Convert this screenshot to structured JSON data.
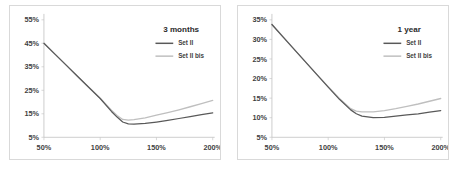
{
  "figure": {
    "series_colors": {
      "set_ii": "#595959",
      "set_ii_bis": "#bfbfbf"
    },
    "frame_color": "#d9d9d9",
    "axis_color": "#bfbfbf"
  },
  "chart_data": [
    {
      "type": "line",
      "title": "3 months",
      "xlabel": "",
      "ylabel": "",
      "grid": false,
      "legend_position": "top-right",
      "xlim": [
        50,
        200
      ],
      "ylim": [
        5,
        55
      ],
      "xticks": [
        50,
        100,
        150,
        200
      ],
      "xtick_labels": [
        "50%",
        "100%",
        "150%",
        "200%"
      ],
      "yticks": [
        5,
        15,
        25,
        35,
        45,
        55
      ],
      "ytick_labels": [
        "5%",
        "15%",
        "25%",
        "35%",
        "45%",
        "55%"
      ],
      "x": [
        50,
        60,
        70,
        80,
        90,
        100,
        110,
        115,
        120,
        125,
        130,
        140,
        150,
        160,
        170,
        180,
        190,
        200
      ],
      "series": [
        {
          "name": "Set II",
          "color": "#595959",
          "values": [
            45.0,
            40.3,
            35.6,
            30.9,
            26.2,
            21.5,
            16.0,
            13.6,
            11.5,
            10.7,
            10.6,
            10.9,
            11.5,
            12.2,
            13.0,
            13.8,
            14.6,
            15.4
          ]
        },
        {
          "name": "Set II bis",
          "color": "#bfbfbf",
          "values": [
            45.0,
            40.3,
            35.6,
            30.9,
            26.2,
            21.6,
            16.5,
            14.3,
            12.6,
            12.3,
            12.5,
            13.3,
            14.4,
            15.5,
            16.7,
            18.0,
            19.3,
            20.7
          ]
        }
      ]
    },
    {
      "type": "line",
      "title": "1 year",
      "xlabel": "",
      "ylabel": "",
      "grid": false,
      "legend_position": "top-right",
      "xlim": [
        50,
        200
      ],
      "ylim": [
        5,
        35
      ],
      "xticks": [
        50,
        100,
        150,
        200
      ],
      "xtick_labels": [
        "50%",
        "100%",
        "150%",
        "200%"
      ],
      "yticks": [
        5,
        10,
        15,
        20,
        25,
        30,
        35
      ],
      "ytick_labels": [
        "5%",
        "10%",
        "15%",
        "20%",
        "25%",
        "30%",
        "35%"
      ],
      "x": [
        50,
        60,
        70,
        80,
        90,
        100,
        110,
        120,
        125,
        130,
        140,
        150,
        160,
        170,
        180,
        190,
        200
      ],
      "series": [
        {
          "name": "Set II",
          "color": "#595959",
          "values": [
            33.8,
            30.6,
            27.4,
            24.2,
            21.0,
            17.8,
            14.7,
            12.0,
            11.0,
            10.4,
            10.0,
            10.1,
            10.4,
            10.7,
            11.0,
            11.4,
            11.8
          ]
        },
        {
          "name": "Set II bis",
          "color": "#bfbfbf",
          "values": [
            33.8,
            30.6,
            27.4,
            24.2,
            21.0,
            17.9,
            14.9,
            12.3,
            11.7,
            11.5,
            11.5,
            11.8,
            12.3,
            12.9,
            13.5,
            14.2,
            14.9
          ]
        }
      ]
    }
  ]
}
